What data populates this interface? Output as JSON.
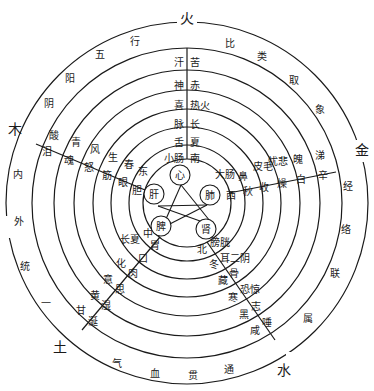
{
  "diagram": {
    "title_ring_outer": [
      "五",
      "行",
      "比",
      "类",
      "取",
      "象"
    ],
    "outer_ring_phrases": {
      "top_left": [
        "阴",
        "阳",
        "五",
        "行"
      ],
      "top_right": [
        "比",
        "类",
        "取",
        "象"
      ],
      "left": [
        "内",
        "外",
        "统",
        "一"
      ],
      "right": [
        "经",
        "络",
        "联",
        "属"
      ],
      "bottom": [
        "气",
        "血",
        "贯",
        "通"
      ]
    },
    "elements": {
      "fire": "火",
      "wood": "木",
      "metal": "金",
      "earth": "土",
      "water": "水"
    },
    "organs_center": {
      "heart": "心",
      "liver": "肝",
      "lung": "肺",
      "spleen": "脾",
      "kidney": "肾"
    },
    "fire_sector": {
      "left_column": [
        "汗",
        "神",
        "喜",
        "脉",
        "舌",
        "小肠"
      ],
      "right_column": [
        "苦",
        "赤",
        "热火",
        "长",
        "夏",
        "南"
      ]
    },
    "wood_sector": {
      "upper_row": [
        "酸",
        "青",
        "风",
        "生",
        "春",
        "东"
      ],
      "lower_row": [
        "泪",
        "魂",
        "怒",
        "筋",
        "眼",
        "胆"
      ]
    },
    "metal_sector": {
      "upper_row": [
        "大肠",
        "鼻",
        "皮毛",
        "忧悲",
        "魄",
        "涕"
      ],
      "lower_row": [
        "西",
        "秋",
        "收",
        "燥",
        "白",
        "辛"
      ]
    },
    "earth_sector": {
      "upper_row": [
        "中",
        "长夏",
        "化",
        "意",
        "黄",
        "甘"
      ],
      "lower_row": [
        "胃",
        "口",
        "肉",
        "思",
        "湿",
        "涎"
      ]
    },
    "water_sector": {
      "upper_row": [
        "北",
        "冬",
        "藏",
        "寒",
        "黑",
        "咸"
      ],
      "lower_row": [
        "膀胱",
        "耳二阴",
        "骨",
        "恐惊",
        "志",
        "唾"
      ]
    },
    "outer_words_bottom": [
      "气",
      "血",
      "贯",
      "通"
    ],
    "outer_words_right": [
      "经",
      "络",
      "联",
      "属"
    ],
    "outer_words_left": [
      "阴",
      "内",
      "外",
      "统",
      "一"
    ],
    "colors": {
      "line": "#1a1a1a",
      "background": "#ffffff"
    }
  }
}
